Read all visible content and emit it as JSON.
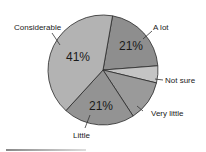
{
  "chart_data": {
    "type": "pie",
    "title": "",
    "categories": [
      "A lot",
      "Not sure",
      "Very little",
      "Little",
      "Considerable"
    ],
    "values": [
      21,
      5,
      12,
      21,
      41
    ],
    "labels_shown_percent": {
      "A lot": "21%",
      "Little": "21%",
      "Considerable": "41%"
    },
    "colors": [
      "#8e8e8e",
      "#c4c4c4",
      "#9a9a9a",
      "#939393",
      "#b3b3b3"
    ],
    "legend": "none (callout labels)"
  },
  "labels": {
    "a_lot": "A lot",
    "not_sure": "Not sure",
    "very_little": "Very little",
    "little": "Little",
    "considerable": "Considerable"
  },
  "percents": {
    "a_lot": "21%",
    "little": "21%",
    "considerable": "41%"
  }
}
